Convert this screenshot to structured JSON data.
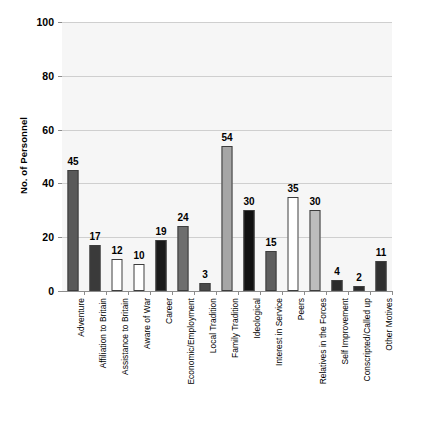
{
  "chart_data": {
    "type": "bar",
    "title": "",
    "xlabel": "",
    "ylabel": "No. of Personnel",
    "ylim": [
      0,
      100
    ],
    "yticks": [
      0,
      20,
      40,
      60,
      80,
      100
    ],
    "grid": true,
    "legend": "none",
    "categories": [
      "Adventure",
      "Affiliation to Britain",
      "Assistance to Britain",
      "Aware of War",
      "Career",
      "Economic/Employment",
      "Local Tradition",
      "Family Tradition",
      "Ideological",
      "Interest in Service",
      "Peers",
      "Relatives in the Forces",
      "Self Improvement",
      "Conscripted/Called up",
      "Other Motives"
    ],
    "values": [
      45,
      17,
      12,
      10,
      19,
      24,
      3,
      54,
      30,
      15,
      35,
      30,
      4,
      2,
      11
    ],
    "bar_colors": [
      "#595959",
      "#3a3a3a",
      "#ffffff",
      "#ffffff",
      "#1a1a1a",
      "#6e6e6e",
      "#4a4a4a",
      "#a6a6a6",
      "#111111",
      "#5e5e5e",
      "#ffffff",
      "#bdbdbd",
      "#2b2b2b",
      "#2b2b2b",
      "#303030"
    ],
    "bar_border": "#3d3d3d",
    "plot_background": "#f6f6f6",
    "gridline_color": "#cfcfcf"
  }
}
